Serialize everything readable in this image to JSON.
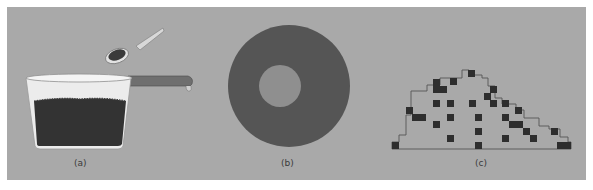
{
  "figure": {
    "background_color": "#a9a9a9",
    "panels": [
      {
        "id": "a",
        "caption": "(a)",
        "description": "Saucepan filled with dark granular material, spoon holding a scoop above it",
        "elements": [
          "saucepan",
          "saucepan-handle",
          "granular-contents",
          "spoon"
        ]
      },
      {
        "id": "b",
        "caption": "(b)",
        "description": "Dark annulus (ring) with lighter gray inner circle",
        "outer_color": "#555555",
        "inner_color": "#8f8f8f"
      },
      {
        "id": "c",
        "caption": "(c)",
        "description": "Staircase-shaped pile outline on a baseline with scattered dark square cells",
        "square_color": "#2e2e2e",
        "outline_color": "#555555",
        "cell_size": 7,
        "outline_points": [
          [
            392,
            149
          ],
          [
            392,
            142
          ],
          [
            399,
            142
          ],
          [
            399,
            135
          ],
          [
            406,
            135
          ],
          [
            406,
            115
          ],
          [
            411,
            115
          ],
          [
            411,
            91
          ],
          [
            427,
            91
          ],
          [
            427,
            85
          ],
          [
            440,
            85
          ],
          [
            440,
            78
          ],
          [
            462,
            78
          ],
          [
            462,
            70
          ],
          [
            469,
            70
          ],
          [
            469,
            75
          ],
          [
            482,
            75
          ],
          [
            482,
            78
          ],
          [
            488,
            78
          ],
          [
            488,
            86
          ],
          [
            495,
            86
          ],
          [
            495,
            98
          ],
          [
            502,
            98
          ],
          [
            502,
            104
          ],
          [
            516,
            104
          ],
          [
            516,
            110
          ],
          [
            524,
            110
          ],
          [
            524,
            118
          ],
          [
            539,
            118
          ],
          [
            539,
            126
          ],
          [
            549,
            126
          ],
          [
            549,
            129
          ],
          [
            560,
            129
          ],
          [
            560,
            137
          ],
          [
            568,
            137
          ],
          [
            568,
            142
          ],
          [
            571,
            142
          ],
          [
            571,
            149
          ]
        ],
        "baseline": {
          "x1": 392,
          "x2": 571,
          "y": 149
        },
        "squares": [
          [
            392,
            142,
            7,
            7
          ],
          [
            406,
            107,
            7,
            7
          ],
          [
            412,
            114,
            14,
            7
          ],
          [
            433,
            121,
            7,
            7
          ],
          [
            433,
            100,
            7,
            7
          ],
          [
            447,
            100,
            7,
            7
          ],
          [
            469,
            100,
            7,
            7
          ],
          [
            447,
            114,
            7,
            7
          ],
          [
            447,
            135,
            7,
            7
          ],
          [
            433,
            79,
            7,
            11
          ],
          [
            433,
            86,
            14,
            7
          ],
          [
            450,
            78,
            7,
            7
          ],
          [
            468,
            70,
            7,
            7
          ],
          [
            475,
            114,
            7,
            7
          ],
          [
            475,
            128,
            7,
            7
          ],
          [
            475,
            142,
            7,
            7
          ],
          [
            484,
            93,
            7,
            7
          ],
          [
            490,
            86,
            7,
            7
          ],
          [
            490,
            100,
            7,
            7
          ],
          [
            502,
            100,
            7,
            7
          ],
          [
            502,
            114,
            7,
            7
          ],
          [
            502,
            135,
            7,
            7
          ],
          [
            515,
            107,
            7,
            7
          ],
          [
            509,
            121,
            14,
            7
          ],
          [
            523,
            128,
            7,
            7
          ],
          [
            530,
            135,
            7,
            7
          ],
          [
            551,
            128,
            7,
            7
          ],
          [
            557,
            142,
            14,
            7
          ]
        ]
      }
    ]
  }
}
